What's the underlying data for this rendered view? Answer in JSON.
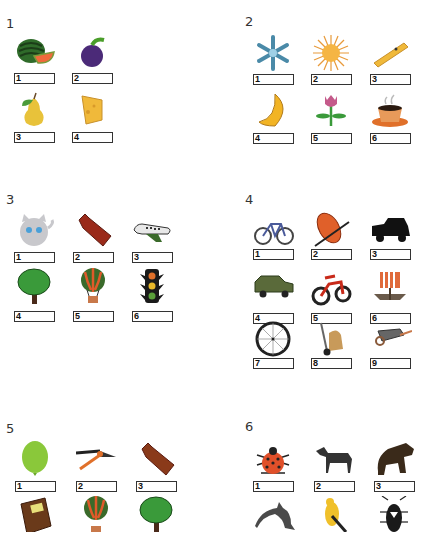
{
  "worksheet": {
    "groups": [
      {
        "label": "1",
        "items": [
          {
            "number": "1",
            "picture": "watermelon"
          },
          {
            "number": "2",
            "picture": "plum"
          },
          {
            "number": "3",
            "picture": "pear"
          },
          {
            "number": "4",
            "picture": "cheese"
          }
        ]
      },
      {
        "label": "2",
        "items": [
          {
            "number": "1",
            "picture": "snowflake"
          },
          {
            "number": "2",
            "picture": "sun"
          },
          {
            "number": "3",
            "picture": "clothespin"
          },
          {
            "number": "4",
            "picture": "moon"
          },
          {
            "number": "5",
            "picture": "tulip"
          },
          {
            "number": "6",
            "picture": "coffee-cup"
          }
        ]
      },
      {
        "label": "3",
        "items": [
          {
            "number": "1",
            "picture": "kitten"
          },
          {
            "number": "2",
            "picture": "hot-water-bottle"
          },
          {
            "number": "3",
            "picture": "airplane"
          },
          {
            "number": "4",
            "picture": "tree"
          },
          {
            "number": "5",
            "picture": "hot-air-balloon"
          },
          {
            "number": "6",
            "picture": "traffic-light"
          }
        ]
      },
      {
        "label": "4",
        "items": [
          {
            "number": "1",
            "picture": "bicycle"
          },
          {
            "number": "2",
            "picture": "inflatable-raft"
          },
          {
            "number": "3",
            "picture": "pickup-truck"
          },
          {
            "number": "4",
            "picture": "suv"
          },
          {
            "number": "5",
            "picture": "motorcycle"
          },
          {
            "number": "6",
            "picture": "viking-ship"
          },
          {
            "number": "7",
            "picture": "wheel"
          },
          {
            "number": "8",
            "picture": "hand-truck"
          },
          {
            "number": "9",
            "picture": "wheelbarrow"
          }
        ]
      },
      {
        "label": "5",
        "items": [
          {
            "number": "1",
            "picture": "balloon"
          },
          {
            "number": "2",
            "picture": "pruning-shears"
          },
          {
            "number": "3",
            "picture": "hot-water-bottle"
          },
          {
            "number": "",
            "picture": "book"
          },
          {
            "number": "",
            "picture": "hot-air-balloon"
          },
          {
            "number": "",
            "picture": "tree"
          }
        ]
      },
      {
        "label": "6",
        "items": [
          {
            "number": "1",
            "picture": "ladybug"
          },
          {
            "number": "2",
            "picture": "horse"
          },
          {
            "number": "3",
            "picture": "bear"
          },
          {
            "number": "",
            "picture": "dolphin"
          },
          {
            "number": "",
            "picture": "canary"
          },
          {
            "number": "",
            "picture": "beetle"
          }
        ]
      }
    ]
  }
}
